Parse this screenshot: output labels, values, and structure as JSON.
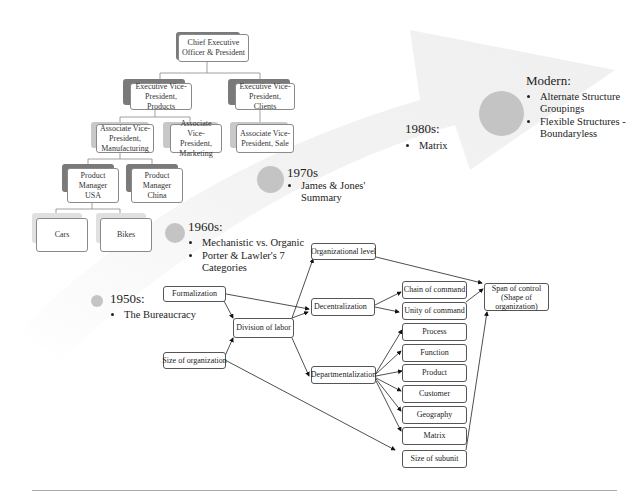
{
  "org_chart": {
    "ceo": "Chief Executive Officer & President",
    "evp_products": "Executive Vice-President, Products",
    "evp_clients": "Executive Vice-President, Clients",
    "avp_manufacturing": "Associate Vice-President, Manufacturing",
    "avp_marketing": "Associate Vice-President, Marketing",
    "avp_sale": "Associate Vice-President, Sale",
    "pm_usa": "Product Manager USA",
    "pm_china": "Product Manager China",
    "cars": "Cars",
    "bikes": "Bikes"
  },
  "timeline": {
    "e1950": {
      "title": "1950s:",
      "bullets": [
        "The Bureaucracy"
      ]
    },
    "e1960": {
      "title": "1960s:",
      "bullets": [
        "Mechanistic vs. Organic",
        "Porter & Lawler's 7 Categories"
      ]
    },
    "e1970": {
      "title": "1970s",
      "bullets": [
        "James & Jones' Summary"
      ]
    },
    "e1980": {
      "title": "1980s:",
      "bullets": [
        "Matrix"
      ]
    },
    "modern": {
      "title": "Modern:",
      "bullets": [
        "Alternate Structure Groupings",
        "Flexible Structures - Boundaryless"
      ]
    },
    "colors": {
      "dot": "#c4c4c4",
      "arrow_band": "#f2f2f2"
    }
  },
  "flow": {
    "formalization": "Formalization",
    "size_org": "Size of organization",
    "division": "Division of labor",
    "org_level": "Organizational level",
    "decentral": "Decentralization",
    "department": "Departmentalization",
    "chain": "Chain of command",
    "unity": "Unity of command",
    "process": "Process",
    "function": "Function",
    "product": "Product",
    "customer": "Customer",
    "geography": "Geography",
    "matrix": "Matrix",
    "subunit": "Size of subunit",
    "span": "Span of control (Shape of organization)"
  }
}
